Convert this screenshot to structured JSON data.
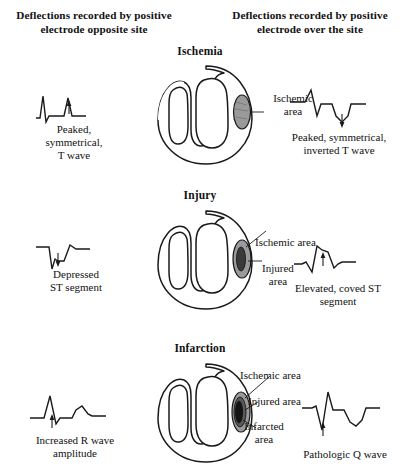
{
  "headers": {
    "left": "Deflections recorded by positive electrode opposite site",
    "right": "Deflections recorded by positive electrode over the site"
  },
  "sections": [
    {
      "id": "ischemia",
      "title": "Ischemia",
      "zones": [
        "Ischemic area"
      ],
      "left_caption": "Peaked, symmetrical, T wave",
      "right_caption": "Peaked, symmetrical, inverted T wave"
    },
    {
      "id": "injury",
      "title": "Injury",
      "zones": [
        "Ischemic area",
        "Injured area"
      ],
      "left_caption": "Depressed ST segment",
      "right_caption": "Elevated, coved ST segment"
    },
    {
      "id": "infarction",
      "title": "Infarction",
      "zones": [
        "Ischemic area",
        "Injured area",
        "Infarcted area"
      ],
      "left_caption": "Increased R wave amplitude",
      "right_caption": "Pathologic Q wave"
    }
  ],
  "labels": {
    "ischemic_area": "Ischemic area",
    "injured_area": "Injured area",
    "infarcted_area": "Infarcted area",
    "ischemic_area_line1": "Ischemic",
    "ischemic_area_line2": "area",
    "injured_area_line1": "Injured",
    "injured_area_line2": "area",
    "infarcted_area_line1": "Infarcted",
    "infarcted_area_line2": "area"
  },
  "captions": {
    "peaked_t": "Peaked, symmetrical, T wave",
    "peaked_t_line1": "Peaked,",
    "peaked_t_line2": "symmetrical,",
    "peaked_t_line3": "T wave",
    "inverted_t_line1": "Peaked, symmetrical,",
    "inverted_t_line2": "inverted T wave",
    "depressed_st_line1": "Depressed",
    "depressed_st_line2": "ST segment",
    "elevated_st_line1": "Elevated, coved ST",
    "elevated_st_line2": "segment",
    "increased_r_line1": "Increased R wave",
    "increased_r_line2": "amplitude",
    "pathologic_q": "Pathologic Q wave"
  },
  "colors": {
    "ink": "#1a1a1a",
    "background": "#ffffff",
    "ischemic_fill": "#9a9a9a",
    "injured_fill": "#5a5a5a",
    "infarcted_fill": "#141414"
  }
}
